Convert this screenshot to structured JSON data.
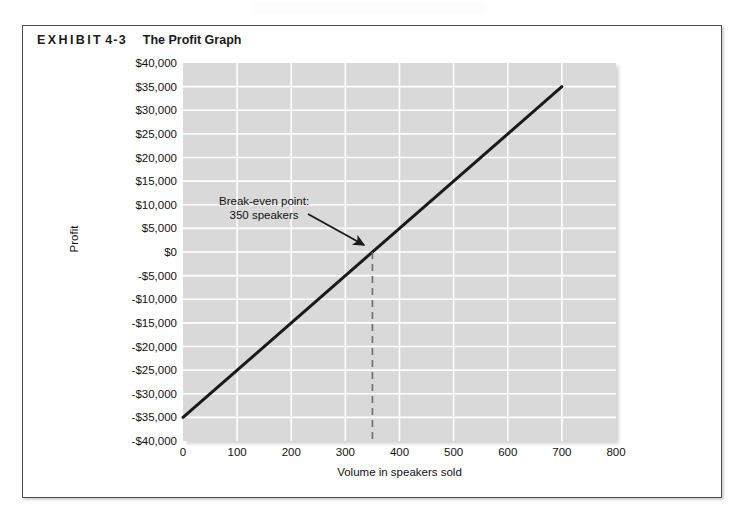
{
  "exhibit": {
    "label": "EXHIBIT",
    "number": "4-3",
    "title": "The Profit Graph"
  },
  "colors": {
    "plot_background": "#d9d9d9",
    "gridline": "#ffffff",
    "series_line": "#1a1a1a",
    "breakeven_dash": "#6b6b6b",
    "border": "#4a4a4d",
    "text": "#111111"
  },
  "chart_data": {
    "type": "line",
    "title": "The Profit Graph",
    "xlabel": "Volume in speakers sold",
    "ylabel": "Profit",
    "xlim": [
      0,
      800
    ],
    "ylim": [
      -40000,
      40000
    ],
    "xticks": [
      0,
      100,
      200,
      300,
      400,
      500,
      600,
      700,
      800
    ],
    "xtick_labels": [
      "0",
      "100",
      "200",
      "300",
      "400",
      "500",
      "600",
      "700",
      "800"
    ],
    "yticks": [
      40000,
      35000,
      30000,
      25000,
      20000,
      15000,
      10000,
      5000,
      0,
      -5000,
      -10000,
      -15000,
      -20000,
      -25000,
      -30000,
      -35000,
      -40000
    ],
    "ytick_labels": [
      "$40,000",
      "$35,000",
      "$30,000",
      "$25,000",
      "$20,000",
      "$15,000",
      "$10,000",
      "$5,000",
      "$0",
      "-$5,000",
      "-$10,000",
      "-$15,000",
      "-$20,000",
      "-$25,000",
      "-$30,000",
      "-$35,000",
      "-$40,000"
    ],
    "grid": true,
    "legend": false,
    "series": [
      {
        "name": "Profit",
        "x": [
          0,
          700
        ],
        "y": [
          -35000,
          35000
        ]
      }
    ],
    "annotations": [
      {
        "name": "break-even",
        "line1": "Break-even point:",
        "line2": "350 speakers",
        "point_x": 350,
        "point_y": 0,
        "dashed_drop_line": true
      }
    ]
  }
}
